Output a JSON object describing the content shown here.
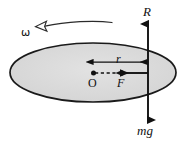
{
  "figure": {
    "type": "physics-free-body-diagram",
    "caption": "Rotating disc with radial force F at radius r from centre O, normal reaction R upward and weight mg downward",
    "background_color": "#ffffff"
  },
  "disc": {
    "name": "rotating-disc",
    "shape": "ellipse",
    "center_x": 93,
    "center_y": 72.5,
    "radius_x": 83,
    "radius_y": 29.5,
    "fill_color": "#d9d9d9",
    "stroke_color": "#1a1a1a",
    "stroke_width": 1.6
  },
  "labels": {
    "normal_reaction": "R",
    "weight": "mg",
    "radius": "r",
    "centre": "O",
    "force": "F",
    "angular_velocity": "ω"
  },
  "vectors": [
    {
      "name": "normal-reaction-arrow",
      "label": "R",
      "direction": "up",
      "x": 148,
      "y_start": 72,
      "y_end": 22,
      "color": "#111111"
    },
    {
      "name": "weight-arrow",
      "label": "mg",
      "direction": "down",
      "x": 148,
      "y_start": 72,
      "y_end": 122,
      "color": "#111111"
    },
    {
      "name": "force-arrow",
      "label": "F",
      "direction": "left",
      "y": 73,
      "x_start": 148,
      "x_end": 120,
      "color": "#111111"
    },
    {
      "name": "radius-dimension-arrow",
      "label": "r",
      "direction": "both",
      "y": 62,
      "x_start": 92,
      "x_end": 148,
      "color": "#111111"
    },
    {
      "name": "angular-velocity-arc-arrow",
      "label": "ω",
      "direction": "counterclockwise",
      "arrowhead_style": "hollow",
      "color": "#333333"
    }
  ],
  "markers": [
    {
      "name": "centre-point",
      "label": "O",
      "x": 93,
      "y": 73,
      "color": "#111111"
    }
  ],
  "guides": [
    {
      "name": "radius-dashed-guide",
      "style": "dashed",
      "y": 73,
      "x_start": 93,
      "x_end": 120,
      "color": "#111111"
    }
  ]
}
